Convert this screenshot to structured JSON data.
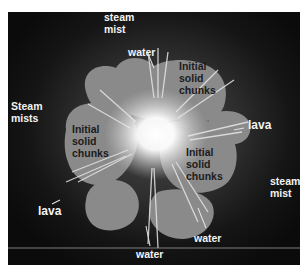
{
  "figure": {
    "colors": {
      "background": "#111111",
      "chunk": "#8c8c8c",
      "glow": "#ffffff",
      "light_text": "#f2f2f2",
      "dark_text": "#1c1c1c"
    },
    "labels": {
      "steam_mist_top": "steam\nmist",
      "water_top": "water",
      "steam_mists_left": "Steam\nmists",
      "chunks_upper_right": "Initial\nsolid\nchunks",
      "chunks_left": "Initial\nsolid\nchunks",
      "chunks_right": "Initial\nsolid\nchunks",
      "lava_right": "lava",
      "lava_left": "lava",
      "steam_mist_right": "steam\nmist",
      "water_bottom_right": "water",
      "water_bottom": "water"
    }
  }
}
